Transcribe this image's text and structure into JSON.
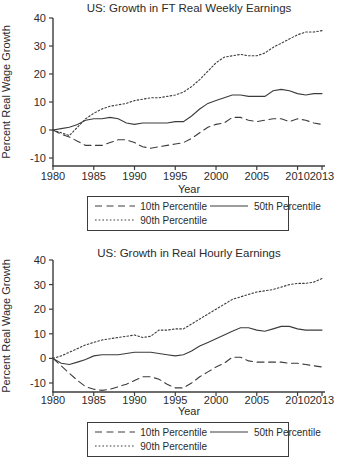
{
  "page": {
    "background": "#ffffff",
    "line_color": "#3c3c3c"
  },
  "chart_data": [
    {
      "type": "line",
      "title": "US: Growth in FT Real Weekly Earnings",
      "xlabel": "Year",
      "ylabel": "Percent Real Wage Growth",
      "xlim": [
        1980,
        2013
      ],
      "ylim": [
        -10,
        40
      ],
      "x_ticks": [
        1980,
        1985,
        1990,
        1995,
        2000,
        2005,
        2010,
        2013
      ],
      "y_ticks": [
        40,
        30,
        20,
        10,
        0,
        -10
      ],
      "grid": false,
      "legend_position": "bottom",
      "x_years_start": 1980,
      "series": [
        {
          "name": "10th Percentile",
          "dash": "long-dash",
          "values": [
            0,
            -1.5,
            -2.5,
            -4,
            -5.5,
            -5.5,
            -5.5,
            -4.5,
            -3.5,
            -3.5,
            -4.5,
            -6,
            -6.5,
            -6,
            -5.5,
            -5,
            -4.5,
            -3,
            -1,
            1,
            2,
            2.5,
            4.5,
            4.5,
            3.5,
            3,
            3.5,
            4,
            4,
            3,
            4,
            3.5,
            2.5,
            2
          ]
        },
        {
          "name": "50th Percentile",
          "dash": "solid",
          "values": [
            0,
            0.5,
            1,
            2,
            3.5,
            4,
            4,
            4.5,
            4,
            2.5,
            2,
            2.5,
            2.5,
            2.5,
            2.5,
            3,
            3,
            5,
            7.5,
            9.5,
            10.5,
            11.5,
            12.5,
            12.5,
            12,
            12,
            12,
            14,
            14.5,
            14,
            13,
            12.5,
            13,
            13
          ]
        },
        {
          "name": "90th Percentile",
          "dash": "dot",
          "values": [
            0,
            -1,
            -2,
            1,
            4,
            6,
            7.5,
            8.5,
            9,
            9.5,
            10.5,
            11,
            11.5,
            11.5,
            12,
            12.5,
            13.5,
            15.5,
            18,
            21,
            24,
            26,
            26.5,
            27,
            26.5,
            26.5,
            27.5,
            29.5,
            31,
            32.5,
            34,
            35,
            35,
            35.5
          ]
        }
      ]
    },
    {
      "type": "line",
      "title": "US: Growth in Real Hourly Earnings",
      "xlabel": "Year",
      "ylabel": "Percent Real Wage Growth",
      "xlim": [
        1980,
        2013
      ],
      "ylim": [
        -10,
        40
      ],
      "x_ticks": [
        1980,
        1985,
        1990,
        1995,
        2000,
        2005,
        2010,
        2013
      ],
      "y_ticks": [
        40,
        30,
        20,
        10,
        0,
        -10
      ],
      "grid": false,
      "legend_position": "bottom",
      "x_years_start": 1980,
      "series": [
        {
          "name": "10th Percentile",
          "dash": "long-dash",
          "values": [
            0,
            -3,
            -6,
            -9,
            -11.5,
            -12.5,
            -13,
            -12.5,
            -11.5,
            -10.5,
            -9,
            -7.5,
            -7.5,
            -8.5,
            -10.5,
            -12,
            -12,
            -10,
            -7.5,
            -5.5,
            -3.5,
            -2,
            0.5,
            0.5,
            -1,
            -1.5,
            -1.5,
            -1.5,
            -1.5,
            -2,
            -2,
            -2.5,
            -3,
            -3.5
          ]
        },
        {
          "name": "50th Percentile",
          "dash": "solid",
          "values": [
            0,
            -2,
            -2.5,
            -1.5,
            -0.5,
            1,
            1.5,
            1.5,
            1.5,
            2,
            2.5,
            2.5,
            2.5,
            2,
            1.5,
            1,
            1.5,
            3,
            5,
            6.5,
            8,
            9.5,
            11,
            12.5,
            12.5,
            11.5,
            11,
            12,
            13,
            13,
            12,
            11.5,
            11.5,
            11.5
          ]
        },
        {
          "name": "90th Percentile",
          "dash": "dot",
          "values": [
            0,
            1,
            2.5,
            4,
            5.5,
            6.5,
            7.5,
            8,
            8.5,
            9,
            9.5,
            8.5,
            9,
            11.5,
            11.5,
            12,
            12,
            14,
            16,
            18,
            20,
            22,
            24,
            25,
            26,
            27,
            27.5,
            28,
            29,
            30,
            30.5,
            30.5,
            31,
            32.5
          ]
        }
      ]
    }
  ]
}
